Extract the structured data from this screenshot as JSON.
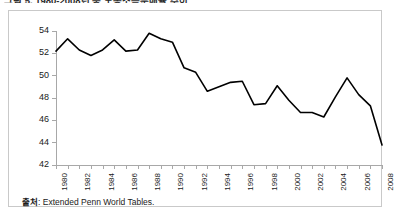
{
  "figure": {
    "cut_off_heading": "그림 5. 1980-2008년 중 노동소득분배율 추이",
    "caption_prefix": "출처",
    "caption_text": ": Extended Penn World Tables."
  },
  "chart_data": {
    "type": "line",
    "title": "",
    "xlabel": "",
    "ylabel": "",
    "ylim": [
      42,
      54
    ],
    "yticks": [
      42,
      44,
      46,
      48,
      50,
      52,
      54
    ],
    "xlim": [
      1980,
      2008
    ],
    "xtick_labels": [
      "1980",
      "1982",
      "1984",
      "1986",
      "1988",
      "1990",
      "1992",
      "1994",
      "1996",
      "1998",
      "2000",
      "2002",
      "2004",
      "2006",
      "2008"
    ],
    "grid": false,
    "legend": null,
    "line_color": "#000000",
    "x": [
      1980,
      1981,
      1982,
      1983,
      1984,
      1985,
      1986,
      1987,
      1988,
      1989,
      1990,
      1991,
      1992,
      1993,
      1994,
      1995,
      1996,
      1997,
      1998,
      1999,
      2000,
      2001,
      2002,
      2003,
      2004,
      2005,
      2006,
      2007,
      2008
    ],
    "series": [
      {
        "name": "노동소득분배율",
        "values": [
          52.2,
          53.3,
          52.3,
          51.8,
          52.3,
          53.2,
          52.2,
          52.3,
          53.8,
          53.3,
          53.0,
          50.7,
          50.3,
          48.6,
          49.0,
          49.4,
          49.5,
          47.4,
          47.5,
          49.1,
          47.8,
          46.7,
          46.7,
          46.3,
          48.1,
          49.8,
          48.3,
          47.3,
          43.8
        ]
      }
    ]
  }
}
